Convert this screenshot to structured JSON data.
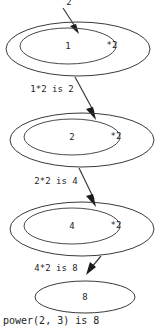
{
  "diagram": {
    "type": "recursion-stack-trace",
    "background_color": "#ffffff",
    "stroke_color": "#3a3a3a",
    "text_color": "#242424",
    "top_argument_label": "2",
    "caption": "power(2, 3) is 8",
    "frames": [
      {
        "accumulator": "1",
        "operation": "*2",
        "result_label": "1*2 is 2"
      },
      {
        "accumulator": "2",
        "operation": "*2",
        "result_label": "2*2 is 4"
      },
      {
        "accumulator": "4",
        "operation": "*2",
        "result_label": "4*2 is 8"
      }
    ],
    "final_frame": {
      "value": "8"
    }
  }
}
